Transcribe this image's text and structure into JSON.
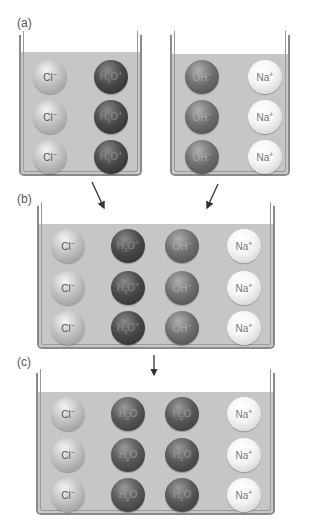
{
  "panels": {
    "a": {
      "label": "(a)",
      "left_beaker": {
        "columns": [
          "Cl⁻",
          "H₃O⁺"
        ],
        "rows": 3
      },
      "right_beaker": {
        "columns": [
          "OH⁻",
          "Na⁺"
        ],
        "rows": 3
      }
    },
    "b": {
      "label": "(b)",
      "columns": [
        "Cl⁻",
        "H₃O⁺",
        "OH⁻",
        "Na⁺"
      ],
      "rows": 3
    },
    "c": {
      "label": "(c)",
      "columns": [
        "Cl⁻",
        "H₂O",
        "H₂O",
        "Na⁺"
      ],
      "rows": 3
    }
  },
  "ions": {
    "cl": {
      "base": "Cl",
      "sup": "−",
      "sub": ""
    },
    "h3o": {
      "base": "H",
      "sub": "3",
      "tail": "O",
      "sup": "+"
    },
    "oh": {
      "base": "OH",
      "sup": "−",
      "sub": ""
    },
    "na": {
      "base": "Na",
      "sup": "+",
      "sub": ""
    },
    "h2o": {
      "base": "H",
      "sub": "2",
      "tail": "O",
      "sup": ""
    }
  },
  "colors": {
    "liquid": "#c6c6c6",
    "wall": "#8a8a8a",
    "arrow": "#333333"
  }
}
